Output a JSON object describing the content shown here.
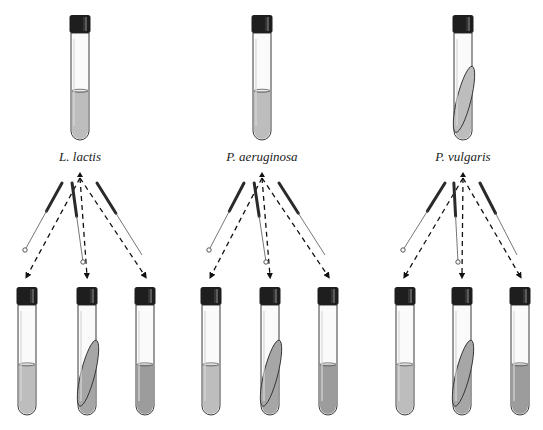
{
  "diagram": {
    "title": "",
    "colors": {
      "cap": "#1e1e1e",
      "cap_highlight": "#9a9a9a",
      "glass_outline": "#3a3a3a",
      "medium_light": "#bdbdbd",
      "medium_dark": "#9c9c9c",
      "slant": "#a6a6a6",
      "arrow": "#111111",
      "background": "#ffffff"
    },
    "groups": [
      {
        "organism": "L. lactis",
        "source_tube": {
          "type": "broth",
          "cx": 80
        },
        "tools": [
          "loop",
          "needle",
          "needle"
        ],
        "targets": [
          {
            "type": "broth",
            "cx": 27,
            "shade": "light"
          },
          {
            "type": "slant",
            "cx": 87,
            "shade": "medium"
          },
          {
            "type": "broth",
            "cx": 145,
            "shade": "dark"
          }
        ]
      },
      {
        "organism": "P. aeruginosa",
        "source_tube": {
          "type": "broth",
          "cx": 262
        },
        "tools": [
          "loop",
          "needle",
          "needle"
        ],
        "targets": [
          {
            "type": "broth",
            "cx": 211,
            "shade": "light"
          },
          {
            "type": "slant",
            "cx": 270,
            "shade": "medium"
          },
          {
            "type": "broth",
            "cx": 328,
            "shade": "dark"
          }
        ]
      },
      {
        "organism": "P. vulgaris",
        "source_tube": {
          "type": "slant",
          "cx": 463
        },
        "tools": [
          "loop",
          "needle",
          "needle"
        ],
        "targets": [
          {
            "type": "broth",
            "cx": 405,
            "shade": "light"
          },
          {
            "type": "slant",
            "cx": 462,
            "shade": "medium"
          },
          {
            "type": "broth",
            "cx": 520,
            "shade": "dark"
          }
        ]
      }
    ]
  }
}
